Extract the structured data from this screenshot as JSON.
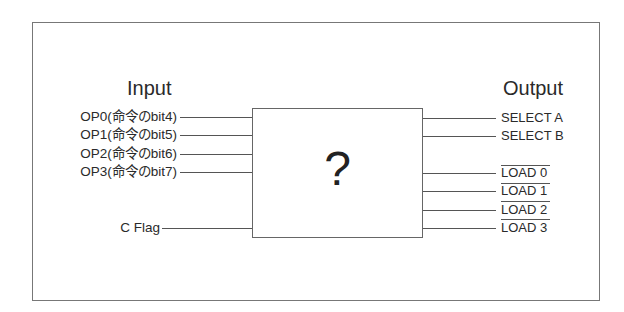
{
  "diagram": {
    "input_heading": "Input",
    "output_heading": "Output",
    "block_label": "?",
    "inputs": [
      {
        "label": "OP0(命令のbit4)",
        "y": 117
      },
      {
        "label": "OP1(命令のbit5)",
        "y": 135
      },
      {
        "label": "OP2(命令のbit6)",
        "y": 154
      },
      {
        "label": "OP3(命令のbit7)",
        "y": 172
      },
      {
        "label": "C Flag",
        "y": 228
      }
    ],
    "outputs": [
      {
        "label": "SELECT A",
        "y": 118,
        "active_low": false
      },
      {
        "label": "SELECT B",
        "y": 136,
        "active_low": false
      },
      {
        "label": "LOAD 0",
        "y": 173,
        "active_low": true
      },
      {
        "label": "LOAD 1",
        "y": 191,
        "active_low": true
      },
      {
        "label": "LOAD 2",
        "y": 210,
        "active_low": true
      },
      {
        "label": "LOAD 3",
        "y": 228,
        "active_low": false
      }
    ]
  }
}
